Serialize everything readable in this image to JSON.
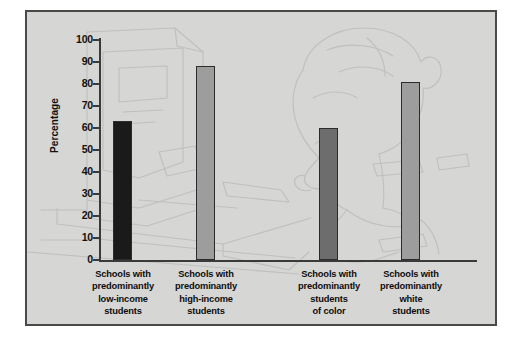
{
  "figure": {
    "background_color": "#d6d6d4",
    "frame_color": "#4a4a4a",
    "watermark_description": "faint line drawing of a child seated at a desktop computer"
  },
  "chart_data": {
    "type": "bar",
    "title": "",
    "xlabel": "",
    "ylabel": "Percentage",
    "ylim": [
      0,
      100
    ],
    "yticks": [
      0,
      10,
      20,
      30,
      40,
      50,
      60,
      70,
      80,
      90,
      100
    ],
    "ytick_labels": [
      "0",
      "10",
      "20",
      "30",
      "40",
      "50",
      "60",
      "70",
      "80",
      "90",
      "100"
    ],
    "grid": false,
    "legend": "none",
    "categories": [
      "Schools with predominantly low-income students",
      "Schools with predominantly high-income students",
      "Schools with predominantly students of color",
      "Schools with predominantly white students"
    ],
    "category_lines": [
      [
        "Schools with",
        "predominantly",
        "low-income",
        "students"
      ],
      [
        "Schools with",
        "predominantly",
        "high-income",
        "students"
      ],
      [
        "Schools with",
        "predominantly",
        "students",
        "of color"
      ],
      [
        "Schools with",
        "predominantly",
        "white",
        "students"
      ]
    ],
    "values": [
      63,
      88,
      60,
      81
    ],
    "bar_colors": [
      "#1a1a1a",
      "#9d9d9d",
      "#6d6d6d",
      "#9d9d9d"
    ]
  }
}
